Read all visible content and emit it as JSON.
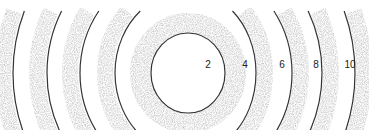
{
  "diagram": {
    "rings": [
      {
        "label": "2"
      },
      {
        "label": "4"
      },
      {
        "label": "6"
      },
      {
        "label": "8"
      },
      {
        "label": "10"
      }
    ],
    "colors": {
      "line": "#333333",
      "shade": "#8a8a8a",
      "background": "#ffffff"
    }
  }
}
